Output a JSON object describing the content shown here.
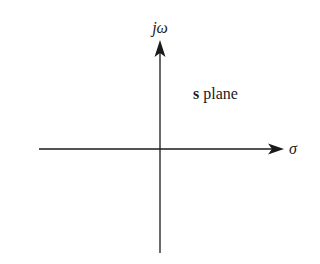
{
  "diagram": {
    "title": "s plane",
    "plane_label_bold": "s",
    "plane_label_rest": " plane",
    "vertical_axis_label": "jω",
    "horizontal_axis_label": "σ",
    "colors": {
      "background": "#ffffff",
      "stroke": "#1a1a1a"
    },
    "axes": {
      "vertical": {
        "x": 160,
        "y_top": 41,
        "y_bottom": 253,
        "arrow": "up"
      },
      "horizontal": {
        "y": 149,
        "x_left": 39,
        "x_right": 283,
        "arrow": "right"
      }
    }
  }
}
